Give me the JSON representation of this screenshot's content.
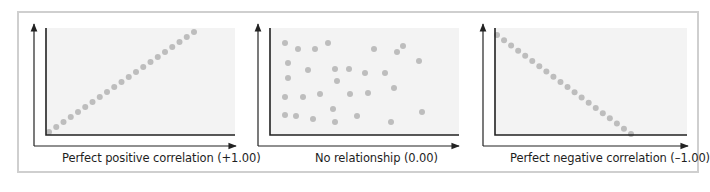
{
  "colors": {
    "frame_border": "#cfcfcf",
    "plot_background": "#f3f3f3",
    "axis": "#222222",
    "dot": "#bdbdbd"
  },
  "panels": [
    {
      "id": "positive",
      "label": "Perfect positive correlation (+1.00)",
      "outer_axis": {
        "x": 34,
        "y_top": 24,
        "y_bottom": 146,
        "x_right": 236
      },
      "plot": {
        "x": 46,
        "y": 28,
        "w": 189,
        "h": 107
      },
      "label_x": 62,
      "dots_line": {
        "from": [
          49,
          132
        ],
        "to": [
          194,
          32
        ],
        "count": 21
      }
    },
    {
      "id": "none",
      "label": "No relationship (0.00)",
      "outer_axis": {
        "x": 258,
        "y_top": 24,
        "y_bottom": 146,
        "x_right": 459
      },
      "plot": {
        "x": 270,
        "y": 28,
        "w": 189,
        "h": 107
      },
      "label_x": 315,
      "dots": [
        [
          285,
          43
        ],
        [
          298,
          49
        ],
        [
          315,
          49
        ],
        [
          328,
          43
        ],
        [
          288,
          63
        ],
        [
          308,
          70
        ],
        [
          335,
          69
        ],
        [
          349,
          69
        ],
        [
          365,
          73
        ],
        [
          385,
          73
        ],
        [
          288,
          78
        ],
        [
          337,
          81
        ],
        [
          285,
          97
        ],
        [
          303,
          97
        ],
        [
          320,
          94
        ],
        [
          350,
          94
        ],
        [
          368,
          93
        ],
        [
          394,
          88
        ],
        [
          285,
          115
        ],
        [
          296,
          116
        ],
        [
          313,
          119
        ],
        [
          333,
          109
        ],
        [
          335,
          122
        ],
        [
          357,
          116
        ],
        [
          391,
          122
        ],
        [
          374,
          49
        ],
        [
          397,
          52
        ],
        [
          403,
          46
        ],
        [
          419,
          61
        ],
        [
          422,
          112
        ]
      ]
    },
    {
      "id": "negative",
      "label": "Perfect negative correlation (–1.00)",
      "outer_axis": {
        "x": 483,
        "y_top": 24,
        "y_bottom": 146,
        "x_right": 688
      },
      "plot": {
        "x": 495,
        "y": 28,
        "w": 192,
        "h": 107
      },
      "label_x": 510,
      "dots_line": {
        "from": [
          497,
          35
        ],
        "to": [
          631,
          134
        ],
        "count": 20
      }
    }
  ],
  "chart_data": [
    {
      "type": "scatter",
      "title": "Perfect positive correlation (+1.00)",
      "xlabel": "Perfect positive correlation (+1.00)",
      "ylabel": "",
      "correlation": 1.0,
      "points": "21 points on a straight ascending line from bottom-left to top-right"
    },
    {
      "type": "scatter",
      "title": "No relationship (0.00)",
      "xlabel": "No relationship (0.00)",
      "ylabel": "",
      "correlation": 0.0,
      "points": "30 randomly scattered points"
    },
    {
      "type": "scatter",
      "title": "Perfect negative correlation (–1.00)",
      "xlabel": "Perfect negative correlation (–1.00)",
      "ylabel": "",
      "correlation": -1.0,
      "points": "20 points on a straight descending line from top-left to bottom-right"
    }
  ]
}
